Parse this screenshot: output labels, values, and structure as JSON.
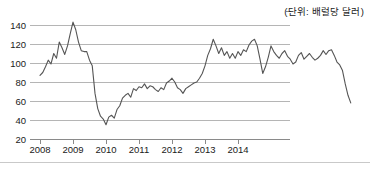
{
  "unit_note": "(단위: 배럴당 달러)",
  "chart_data": {
    "type": "line",
    "title": "",
    "subtitle": "",
    "xlabel": "",
    "ylabel": "",
    "unit_label": "(단위: 배럴당 달러)",
    "grid": true,
    "legend": null,
    "legend_position": "none",
    "line_color": "#555555",
    "grid_color": "#b5b5b5",
    "axis_color": "#8a8a8a",
    "ylim": [
      20,
      145
    ],
    "yticks": [
      20,
      40,
      60,
      80,
      100,
      120,
      140
    ],
    "ytick_labels": [
      "20",
      "40",
      "60",
      "80",
      "100",
      "120",
      "140"
    ],
    "xlim": [
      2008.0,
      2014.95
    ],
    "xticks": [
      2008,
      2009,
      2010,
      2011,
      2012,
      2013,
      2014
    ],
    "xtick_labels": [
      "2008",
      "2009",
      "2010",
      "2011",
      "2012",
      "2013",
      "2014"
    ],
    "x_is_monthly": true,
    "x_start": 2008.0,
    "x_step": 0.08333,
    "series": [
      {
        "name": "유가",
        "values": [
          87,
          90,
          96,
          103,
          99,
          110,
          105,
          122,
          116,
          109,
          118,
          131,
          143,
          135,
          122,
          113,
          112,
          112,
          103,
          97,
          68,
          52,
          44,
          41,
          35,
          43,
          45,
          42,
          51,
          55,
          63,
          66,
          68,
          64,
          73,
          71,
          75,
          74,
          78,
          73,
          76,
          75,
          72,
          70,
          74,
          72,
          79,
          81,
          84,
          80,
          74,
          72,
          68,
          73,
          75,
          77,
          79,
          80,
          84,
          89,
          97,
          108,
          115,
          125,
          118,
          110,
          116,
          108,
          112,
          105,
          110,
          105,
          112,
          108,
          114,
          112,
          119,
          123,
          125,
          118,
          104,
          89,
          96,
          106,
          118,
          112,
          108,
          105,
          110,
          113,
          107,
          104,
          99,
          101,
          108,
          111,
          104,
          107,
          110,
          106,
          103,
          105,
          108,
          113,
          109,
          113,
          114,
          108,
          101,
          98,
          92,
          78,
          66,
          58
        ]
      }
    ],
    "annotations": [
      {
        "text": "(단위: 배럴당 달러)",
        "position": "top-right"
      }
    ]
  }
}
